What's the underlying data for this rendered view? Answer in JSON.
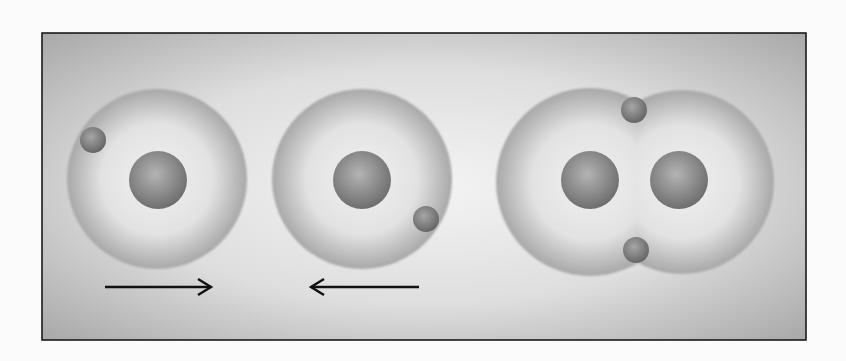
{
  "diagram": {
    "colors": {
      "page_background": "#fbfbfb",
      "frame_border": "#1a1a1a",
      "panel_edge": "#a9a9a9",
      "panel_center": "#f4f4f4",
      "cloud_edge": "#a8a8a8",
      "cloud_center": "#f0f0f0",
      "nucleus_light": "#b4b4b4",
      "nucleus_dark": "#6e6e6e",
      "electron_light": "#a6a6a6",
      "electron_dark": "#666666",
      "arrow": "#111111"
    },
    "atoms": [
      {
        "name": "hydrogen-atom-left",
        "nuclei": 1,
        "electrons": 1,
        "electron_position": "upper-left"
      },
      {
        "name": "hydrogen-atom-right",
        "nuclei": 1,
        "electrons": 1,
        "electron_position": "lower-right"
      }
    ],
    "molecule": {
      "name": "hydrogen-molecule",
      "nuclei": 2,
      "electrons": 2,
      "shared_electrons": "top and bottom of overlap"
    },
    "arrows": [
      {
        "name": "arrow-right",
        "direction": "right"
      },
      {
        "name": "arrow-left",
        "direction": "left"
      }
    ]
  }
}
